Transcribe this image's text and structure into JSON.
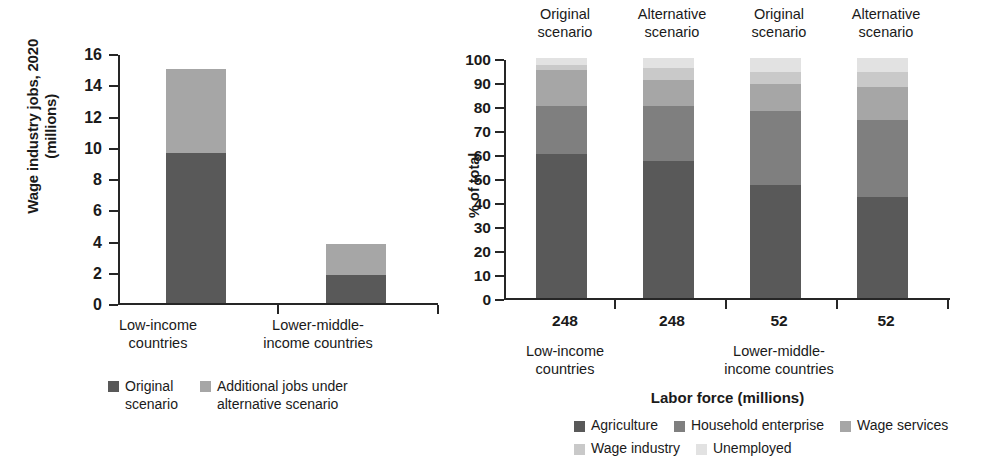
{
  "colors": {
    "agriculture": "#595959",
    "household_enterprise": "#7f7f7f",
    "wage_services": "#a6a6a6",
    "wage_industry": "#c9c9c9",
    "unemployed": "#e2e2e2",
    "original_scenario": "#595959",
    "additional_jobs": "#a6a6a6",
    "axis": "#262626"
  },
  "left_chart": {
    "ylabel_line1": "Wage industry jobs, 2020",
    "ylabel_line2": "(millions)",
    "yticks": [
      "0",
      "2",
      "4",
      "6",
      "8",
      "10",
      "12",
      "14",
      "16"
    ],
    "categories": [
      {
        "line1": "Low-income",
        "line2": "countries"
      },
      {
        "line1": "Lower-middle-",
        "line2": "income countries"
      }
    ],
    "legend": [
      {
        "label_line1": "Original",
        "label_line2": "scenario",
        "color_key": "original_scenario"
      },
      {
        "label_line1": "Additional jobs under",
        "label_line2": "alternative scenario",
        "color_key": "additional_jobs"
      }
    ]
  },
  "right_chart": {
    "ylabel": "% of total",
    "yticks": [
      "0",
      "10",
      "20",
      "30",
      "40",
      "50",
      "60",
      "70",
      "80",
      "90",
      "100"
    ],
    "scenarios": [
      {
        "line1": "Original",
        "line2": "scenario"
      },
      {
        "line1": "Alternative",
        "line2": "scenario"
      },
      {
        "line1": "Original",
        "line2": "scenario"
      },
      {
        "line1": "Alternative",
        "line2": "scenario"
      }
    ],
    "values": [
      "248",
      "248",
      "52",
      "52"
    ],
    "groups": [
      {
        "line1": "Low-income",
        "line2": "countries"
      },
      {
        "line1": "Lower-middle-",
        "line2": "income countries"
      }
    ],
    "xlabel": "Labor force (millions)",
    "legend": [
      {
        "label": "Agriculture",
        "color_key": "agriculture"
      },
      {
        "label": "Household enterprise",
        "color_key": "household_enterprise"
      },
      {
        "label": "Wage services",
        "color_key": "wage_services"
      },
      {
        "label": "Wage industry",
        "color_key": "wage_industry"
      },
      {
        "label": "Unemployed",
        "color_key": "unemployed"
      }
    ]
  },
  "chart_data": [
    {
      "type": "bar",
      "id": "left",
      "stacked": true,
      "title": "",
      "xlabel": "",
      "ylabel": "Wage industry jobs, 2020 (millions)",
      "ylim": [
        0,
        16
      ],
      "ytick_step": 2,
      "grid": false,
      "categories": [
        "Low-income countries",
        "Lower-middle-income countries"
      ],
      "series": [
        {
          "name": "Original scenario",
          "color": "#595959",
          "values": [
            9.6,
            1.8
          ]
        },
        {
          "name": "Additional jobs under alternative scenario",
          "color": "#a6a6a6",
          "values": [
            5.4,
            2.0
          ]
        }
      ],
      "totals": [
        15.0,
        3.8
      ]
    },
    {
      "type": "bar",
      "id": "right",
      "stacked": true,
      "title": "",
      "xlabel": "Labor force (millions)",
      "ylabel": "% of total",
      "ylim": [
        0,
        100
      ],
      "ytick_step": 10,
      "grid": false,
      "categories": [
        "248",
        "248",
        "52",
        "52"
      ],
      "category_scenarios": [
        "Original scenario",
        "Alternative scenario",
        "Original scenario",
        "Alternative scenario"
      ],
      "category_groups": [
        "Low-income countries",
        "Low-income countries",
        "Lower-middle-income countries",
        "Lower-middle-income countries"
      ],
      "series": [
        {
          "name": "Agriculture",
          "color": "#595959",
          "values": [
            60,
            57,
            47,
            42
          ]
        },
        {
          "name": "Household enterprise",
          "color": "#7f7f7f",
          "values": [
            20,
            23,
            31,
            32
          ]
        },
        {
          "name": "Wage services",
          "color": "#a6a6a6",
          "values": [
            15,
            11,
            11,
            14
          ]
        },
        {
          "name": "Wage industry",
          "color": "#c9c9c9",
          "values": [
            2,
            5,
            5,
            6
          ]
        },
        {
          "name": "Unemployed",
          "color": "#e2e2e2",
          "values": [
            3,
            4,
            6,
            6
          ]
        }
      ]
    }
  ]
}
